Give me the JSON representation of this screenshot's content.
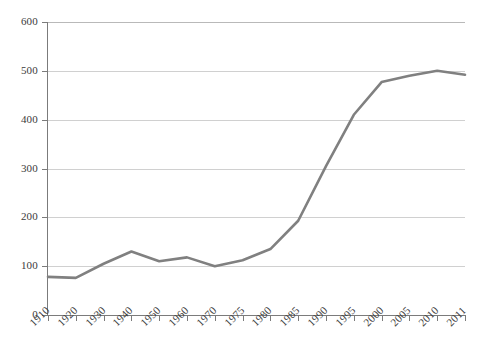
{
  "chart_data": {
    "type": "line",
    "title": "",
    "subtitle": "",
    "xlabel": "",
    "ylabel": "",
    "categories": [
      "1910",
      "1920",
      "1930",
      "1940",
      "1950",
      "1960",
      "1970",
      "1975",
      "1980",
      "1985",
      "1990",
      "1995",
      "2000",
      "2005",
      "2010",
      "2011"
    ],
    "series": [
      {
        "name": "",
        "color": "#808080",
        "values": [
          78,
          76,
          105,
          130,
          110,
          118,
          100,
          112,
          135,
          193,
          305,
          410,
          477,
          490,
          500,
          492
        ]
      }
    ],
    "ylim": [
      0,
      600
    ],
    "yticks": [
      0,
      100,
      200,
      300,
      400,
      500,
      600
    ],
    "ytick_labels": [
      "0",
      "100",
      "200",
      "300",
      "400",
      "500",
      "600"
    ],
    "grid": "horizontal",
    "legend": "none",
    "gridline_color": "#d0d0d0",
    "axis_color": "#7b7b7b",
    "background_color": "#ffffff",
    "xtick_rotation": -45
  }
}
